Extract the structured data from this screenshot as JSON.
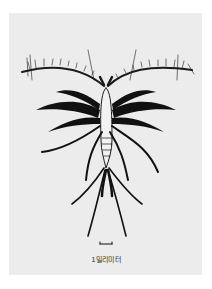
{
  "figure": {
    "scale_bar_label": "1밀리미터"
  }
}
